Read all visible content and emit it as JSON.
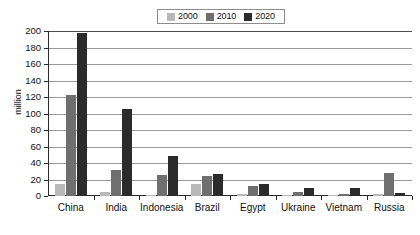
{
  "chart_data": {
    "type": "bar",
    "title": "",
    "subtitle": "",
    "xlabel": "",
    "ylabel": "million",
    "ylim": [
      0,
      200
    ],
    "ytick_step": 20,
    "yticks": [
      200,
      180,
      160,
      140,
      120,
      100,
      80,
      60,
      40,
      20,
      0
    ],
    "grid": "horizontal",
    "legend_position": "top-center",
    "categories": [
      "China",
      "India",
      "Indonesia",
      "Brazil",
      "Egypt",
      "Ukraine",
      "Vietnam",
      "Russia"
    ],
    "series": [
      {
        "name": "2000",
        "color": "#b9b9b9",
        "values": [
          15,
          5,
          1,
          15,
          3,
          0.5,
          0.5,
          2
        ]
      },
      {
        "name": "2010",
        "color": "#6f6f6f",
        "values": [
          123,
          32,
          25,
          24,
          12,
          5,
          3,
          28
        ]
      },
      {
        "name": "2020",
        "color": "#2b2b2b",
        "values": [
          197,
          106,
          49,
          27,
          15,
          10,
          10,
          4
        ]
      }
    ]
  },
  "legend": {
    "entries": [
      {
        "label": "2000",
        "swatch_color": "#b9b9b9"
      },
      {
        "label": "2010",
        "swatch_color": "#6f6f6f"
      },
      {
        "label": "2020",
        "swatch_color": "#2b2b2b"
      }
    ]
  },
  "axes": {
    "y_axis_title": "million"
  },
  "colors": {
    "background": "#ffffff",
    "axis": "#2b2b2b",
    "gridline": "#9a9a9a",
    "text": "#111111",
    "legend_border": "#8d8d8d"
  }
}
